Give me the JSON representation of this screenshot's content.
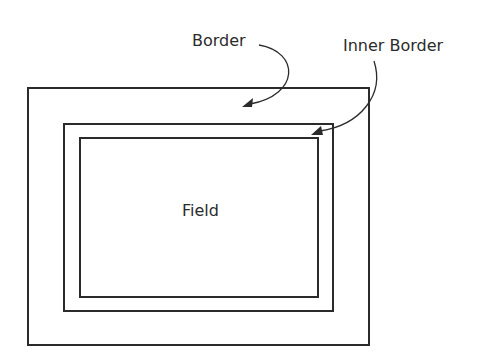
{
  "diagram": {
    "title": "",
    "colors": {
      "stroke": "#2b2b2b",
      "background": "#ffffff"
    },
    "regions": {
      "border": {
        "label": "Border"
      },
      "inner_border": {
        "label": "Inner Border"
      },
      "field": {
        "label": "Field"
      }
    },
    "annotations": [
      {
        "label": "Border",
        "points_to": "border"
      },
      {
        "label": "Inner Border",
        "points_to": "inner_border"
      }
    ]
  }
}
